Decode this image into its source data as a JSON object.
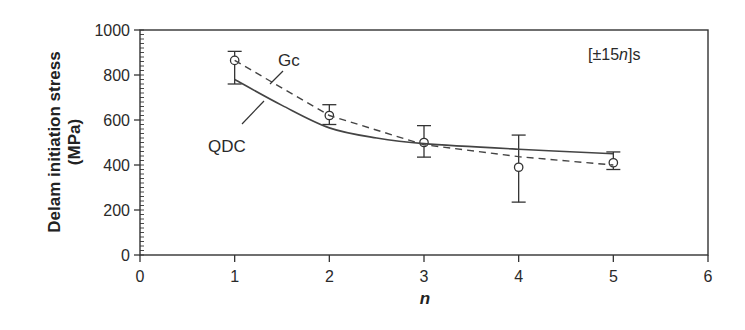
{
  "chart_data": {
    "type": "line",
    "title": "",
    "xlabel": "n",
    "ylabel": "Delam initiation stress (MPa)",
    "ylabel_lines": [
      "Delam initiation stress",
      "(MPa)"
    ],
    "xlim": [
      0,
      6
    ],
    "ylim": [
      0,
      1000
    ],
    "x_ticks": [
      0,
      1,
      2,
      3,
      4,
      5,
      6
    ],
    "y_ticks": [
      0,
      200,
      400,
      600,
      800,
      1000
    ],
    "grid": false,
    "legend": "inline labels",
    "annotation": "[±15n]s",
    "annotation_parts": {
      "prefix": "[±15",
      "italic": "n",
      "suffix": "]s"
    },
    "series": [
      {
        "name": "Experiment",
        "style": "markers",
        "marker": "open-circle",
        "x": [
          1,
          2,
          3,
          4,
          5
        ],
        "values": [
          865,
          620,
          500,
          390,
          410
        ],
        "error_low": [
          760,
          580,
          435,
          235,
          380
        ],
        "error_high": [
          905,
          668,
          575,
          533,
          458
        ]
      },
      {
        "name": "Gc",
        "style": "dashed",
        "x": [
          1,
          2,
          3,
          4,
          5
        ],
        "values": [
          865,
          620,
          490,
          437,
          400
        ]
      },
      {
        "name": "QDC",
        "style": "solid",
        "x": [
          1,
          1.5,
          2,
          2.5,
          3,
          4,
          5
        ],
        "values": [
          780,
          665,
          565,
          520,
          495,
          470,
          450
        ]
      }
    ],
    "labels": {
      "gc": "Gc",
      "qdc": "QDC"
    }
  }
}
